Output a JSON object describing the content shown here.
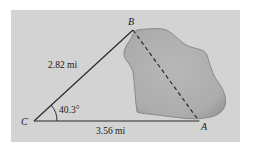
{
  "diagram": {
    "type": "triangle-with-lake",
    "colors": {
      "background": "#ffffff",
      "panel": "#d3d3d3",
      "lake_fill": "#b3b3b3",
      "lake_edge": "#8a8a8a",
      "lines": "#2a2a2a"
    },
    "vertices": {
      "A": {
        "label": "A",
        "x": 199,
        "y": 120
      },
      "B": {
        "label": "B",
        "x": 133,
        "y": 30
      },
      "C": {
        "label": "C",
        "x": 34,
        "y": 121
      }
    },
    "sides": {
      "CB": {
        "label": "2.82 mi",
        "style": "solid"
      },
      "CA": {
        "label": "3.56 mi",
        "style": "solid"
      },
      "AB": {
        "label": "",
        "style": "dashed"
      }
    },
    "angle": {
      "vertex": "C",
      "label": "40.3°"
    },
    "obstacle": {
      "name": "lake"
    }
  }
}
